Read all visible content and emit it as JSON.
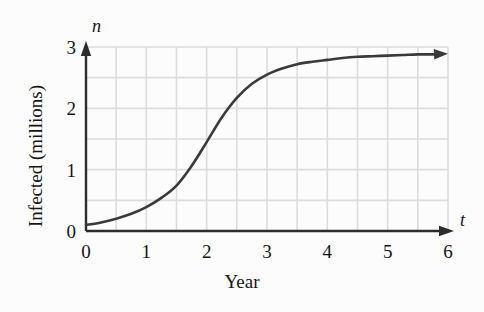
{
  "chart_data": {
    "type": "line",
    "title": "",
    "xlabel": "Year",
    "ylabel": "Infected (millions)",
    "x_axis_variable": "t",
    "y_axis_variable": "n",
    "xlim": [
      0,
      6
    ],
    "ylim": [
      0,
      3
    ],
    "x_ticks": [
      "0",
      "1",
      "2",
      "3",
      "4",
      "5",
      "6"
    ],
    "y_ticks": [
      "0",
      "1",
      "2",
      "3"
    ],
    "x_tick_values": [
      0,
      1,
      2,
      3,
      4,
      5,
      6
    ],
    "y_tick_values": [
      0,
      1,
      2,
      3
    ],
    "grid": true,
    "grid_step_x": 0.5,
    "grid_step_y": 0.5,
    "grid_color": "#dcdcdc",
    "legend": null,
    "series": [
      {
        "name": "Infected",
        "color": "#3a3a3a",
        "x": [
          0,
          0.25,
          0.5,
          0.75,
          1,
          1.25,
          1.5,
          1.75,
          2,
          2.25,
          2.5,
          2.75,
          3,
          3.25,
          3.5,
          3.75,
          4,
          4.25,
          4.5,
          4.75,
          5,
          5.25,
          5.5,
          5.75,
          6
        ],
        "values": [
          0.1,
          0.14,
          0.2,
          0.28,
          0.39,
          0.54,
          0.74,
          1.06,
          1.45,
          1.85,
          2.17,
          2.4,
          2.55,
          2.65,
          2.72,
          2.76,
          2.79,
          2.82,
          2.84,
          2.85,
          2.86,
          2.87,
          2.88,
          2.88,
          2.89
        ]
      }
    ]
  },
  "axes": {
    "x_arrow": true,
    "y_arrow": true,
    "curve_end_arrow": true
  }
}
